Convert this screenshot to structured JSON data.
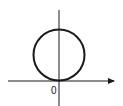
{
  "diagram": {
    "type": "circle-tangent-to-x-axis",
    "origin_label": "0",
    "colors": {
      "stroke": "#1a1a1a",
      "background": "#ffffff"
    },
    "axes": {
      "x_axis": {
        "has_arrow": true,
        "direction": "right"
      },
      "y_axis": {
        "has_arrow": false
      }
    },
    "circle": {
      "center_on": "y-axis",
      "tangent_point": "origin"
    }
  }
}
